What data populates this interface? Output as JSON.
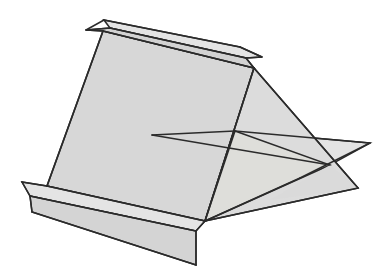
{
  "figure": {
    "type": "geometric-line-drawing",
    "canvas": {
      "width": 386,
      "height": 276,
      "background": "#ffffff"
    },
    "palette": {
      "background": "#ffffff",
      "face_primary": "#d7d7d7",
      "face_secondary": "#dedede",
      "face_light": "#e9e9e9",
      "face_flap": "#d2d2d2",
      "face_flap_light": "#e4e4e4",
      "outline": "#2b2b2b",
      "outline_soft": "#3a3a3a"
    },
    "stroke_width": 1.6,
    "vertices": {
      "top_flap_tip_left": [
        86,
        30
      ],
      "top_flap_back_left": [
        104,
        20
      ],
      "top_flap_back_right": [
        240,
        47
      ],
      "top_ridge_left": [
        103,
        31
      ],
      "top_ridge_right": [
        254,
        68
      ],
      "apex": [
        254,
        68
      ],
      "upper_flap_outer_right": [
        262,
        57
      ],
      "left_fold_top": [
        103,
        31
      ],
      "left_fold_bottom": [
        47,
        186
      ],
      "bottom_junction": [
        205,
        221
      ],
      "bottom_flap_tip_left": [
        22,
        182
      ],
      "bottom_flap_left": [
        30,
        196
      ],
      "bottom_sheet_left": [
        30,
        196
      ],
      "bottom_sheet_bottom": [
        196,
        265
      ],
      "bottom_sheet_right": [
        205,
        247
      ],
      "horiz_plane_left": [
        152,
        135
      ],
      "horiz_plane_mid": [
        235,
        131
      ],
      "horiz_plane_right_tip": [
        370,
        143
      ],
      "horiz_plane_lower_tip": [
        358,
        188
      ],
      "cross_point": [
        330,
        165
      ]
    },
    "faces": [
      {
        "name": "inclined-main-face",
        "shade": "#d7d7d7"
      },
      {
        "name": "top-flap-upper",
        "shade": "#e4e4e4"
      },
      {
        "name": "top-flap-lower",
        "shade": "#d2d2d2"
      },
      {
        "name": "right-triangular-face",
        "shade": "#dcdcdc"
      },
      {
        "name": "horizontal-plane-left",
        "shade": "#e9e9e9"
      },
      {
        "name": "horizontal-plane-right",
        "shade": "#e3e3e3"
      },
      {
        "name": "bottom-flap-upper",
        "shade": "#e4e4e4"
      },
      {
        "name": "bottom-flap-lower",
        "shade": "#d4d4d4"
      }
    ]
  }
}
